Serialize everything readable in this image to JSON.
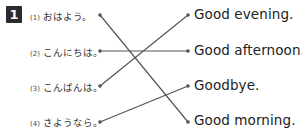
{
  "exercise": {
    "number": "1",
    "left_items": [
      {
        "num": "(1)",
        "text": "おはよう。"
      },
      {
        "num": "(2)",
        "text": "こんにちは。"
      },
      {
        "num": "(3)",
        "text": "こんばんは。"
      },
      {
        "num": "(4)",
        "text": "さようなら。"
      }
    ],
    "right_items": [
      {
        "text": "Good evening."
      },
      {
        "text": "Good afternoon."
      },
      {
        "text": "Goodbye."
      },
      {
        "text": "Good morning."
      }
    ],
    "matches": [
      {
        "left": 1,
        "right": 4
      },
      {
        "left": 2,
        "right": 2
      },
      {
        "left": 3,
        "right": 1
      },
      {
        "left": 4,
        "right": 3
      }
    ],
    "line_color": "#555555"
  }
}
